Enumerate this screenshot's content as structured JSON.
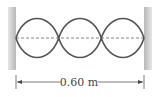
{
  "diagram": {
    "type": "standing-wave",
    "loops": 3,
    "length_label": "0.60 m",
    "colors": {
      "wave": "#555555",
      "axis_dashed": "#666666",
      "wall": "#c8c8c8",
      "dimension_line": "#444444"
    }
  }
}
